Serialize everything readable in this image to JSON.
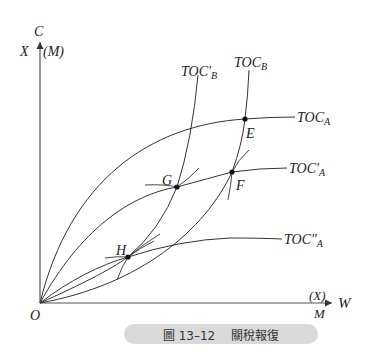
{
  "axes": {
    "y_top": "C",
    "y_left": "X",
    "y_right": "(M)",
    "x_right": "W",
    "x_above": "(X)",
    "x_below": "M",
    "origin": "O"
  },
  "curves": {
    "toc_a": {
      "base": "TOC",
      "sub": "A",
      "prime": ""
    },
    "toc_a1": {
      "base": "TOC",
      "sub": "A",
      "prime": "′"
    },
    "toc_a2": {
      "base": "TOC",
      "sub": "A",
      "prime": "″"
    },
    "toc_b": {
      "base": "TOC",
      "sub": "B",
      "prime": ""
    },
    "toc_b1": {
      "base": "TOC",
      "sub": "B",
      "prime": "′"
    }
  },
  "points": {
    "e": "E",
    "f": "F",
    "g": "G",
    "h": "H"
  },
  "caption": {
    "number": "圖 13–12",
    "title": "關稅報復"
  },
  "colors": {
    "line": "#333333",
    "caption_bg": "#d9d9d9"
  }
}
